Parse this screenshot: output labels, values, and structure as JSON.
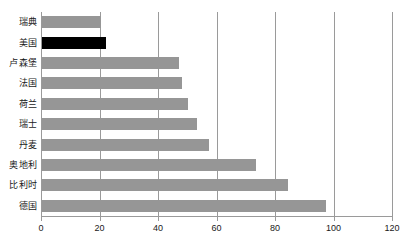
{
  "chart_data": {
    "type": "bar",
    "orientation": "horizontal",
    "title": "",
    "xlabel": "",
    "ylabel": "",
    "xlim": [
      0,
      120
    ],
    "xticks": [
      0,
      20,
      40,
      60,
      80,
      100,
      120
    ],
    "xtick_labels": [
      "0",
      "20",
      "40",
      "60",
      "80",
      "100",
      "120"
    ],
    "grid": true,
    "grid_axis": "x",
    "legend": false,
    "categories": [
      "瑞典",
      "美国",
      "卢森堡",
      "法国",
      "荷兰",
      "瑞士",
      "丹麦",
      "奥地利",
      "比利时",
      "德国"
    ],
    "values": [
      20,
      22,
      47,
      48,
      50,
      53,
      57,
      73,
      84,
      97
    ],
    "bar_color": "#969696",
    "highlight_color": "#000000",
    "highlight_category": "美国",
    "bars": [
      {
        "label": "瑞典",
        "value": 20,
        "highlight": false
      },
      {
        "label": "美国",
        "value": 22,
        "highlight": true
      },
      {
        "label": "卢森堡",
        "value": 47,
        "highlight": false
      },
      {
        "label": "法国",
        "value": 48,
        "highlight": false
      },
      {
        "label": "荷兰",
        "value": 50,
        "highlight": false
      },
      {
        "label": "瑞士",
        "value": 53,
        "highlight": false
      },
      {
        "label": "丹麦",
        "value": 57,
        "highlight": false
      },
      {
        "label": "奥地利",
        "value": 73,
        "highlight": false
      },
      {
        "label": "比利时",
        "value": 84,
        "highlight": false
      },
      {
        "label": "德国",
        "value": 97,
        "highlight": false
      }
    ]
  }
}
